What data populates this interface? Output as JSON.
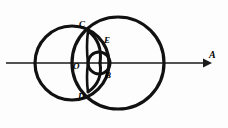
{
  "figure": {
    "background_color": "#fdfdfd",
    "stroke_color": "#111111",
    "axis_color": "#1a1a1a",
    "labels": {
      "C": "C",
      "D": "D",
      "E": "E",
      "B": "B",
      "O": "O",
      "A": "A"
    },
    "axis": {
      "name": "horizontal-axis-with-arrow",
      "y": 63,
      "x_start": 6,
      "x_end": 206,
      "arrowhead": "right"
    },
    "shapes": [
      {
        "name": "large-left-circle",
        "type": "circle",
        "cx": 72,
        "cy": 63,
        "r": 37,
        "stroke_width": 3.2
      },
      {
        "name": "large-right-circle",
        "type": "circle",
        "cx": 118,
        "cy": 63,
        "r": 46,
        "stroke_width": 3.2
      },
      {
        "name": "small-inner-circle",
        "type": "circle",
        "cx": 99,
        "cy": 63,
        "r": 11,
        "stroke_width": 3.0
      },
      {
        "name": "inner-arc-left-upper",
        "type": "arc",
        "cx": 88,
        "cy": 31,
        "r": 33,
        "stroke_width": 3.0
      },
      {
        "name": "inner-arc-left-lower",
        "type": "arc",
        "cx": 88,
        "cy": 92,
        "r": 33,
        "stroke_width": 3.0
      }
    ],
    "points": [
      {
        "name": "point-C",
        "label": "C",
        "x": 88,
        "y": 31
      },
      {
        "name": "point-D",
        "label": "D",
        "x": 88,
        "y": 92
      },
      {
        "name": "point-E",
        "label": "E",
        "x": 100,
        "y": 47
      },
      {
        "name": "point-B",
        "label": "B",
        "x": 100,
        "y": 74
      },
      {
        "name": "point-O",
        "label": "O",
        "x": 88,
        "y": 63
      },
      {
        "name": "point-A",
        "label": "A",
        "x": 206,
        "y": 63
      }
    ]
  }
}
